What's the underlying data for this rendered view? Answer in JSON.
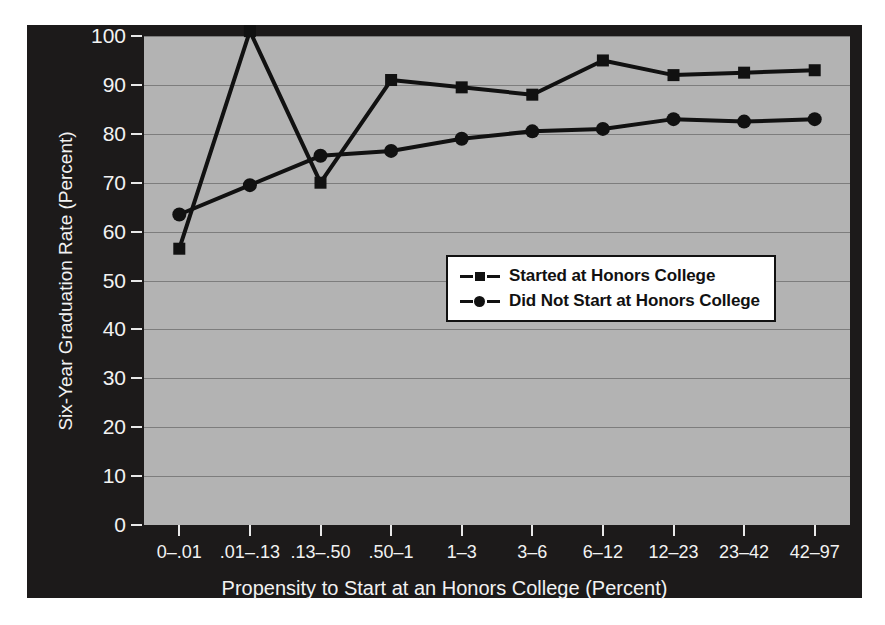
{
  "chart_data": {
    "type": "line",
    "title": "",
    "xlabel": "Propensity to Start at an Honors College (Percent)",
    "ylabel": "Six-Year Graduation Rate (Percent)",
    "categories": [
      "0–.01",
      ".01–.13",
      ".13–.50",
      ".50–1",
      "1–3",
      "3–6",
      "6–12",
      "12–23",
      "23–42",
      "42–97"
    ],
    "ylim": [
      0,
      100
    ],
    "yticks": [
      0,
      10,
      20,
      30,
      40,
      50,
      60,
      70,
      80,
      90,
      100
    ],
    "ytick_labels": [
      "0",
      "10",
      "20",
      "30",
      "40",
      "50",
      "60",
      "70",
      "80",
      "90",
      "100"
    ],
    "grid": true,
    "legend_position": "center-right",
    "series": [
      {
        "name": "Started at Honors College",
        "marker": "square",
        "values": [
          56.5,
          101.0,
          70.0,
          91.0,
          89.5,
          88.0,
          95.0,
          92.0,
          92.5,
          93.0
        ]
      },
      {
        "name": "Did Not Start at Honors College",
        "marker": "circle",
        "values": [
          63.5,
          69.5,
          75.5,
          76.5,
          79.0,
          80.5,
          81.0,
          83.0,
          82.5,
          83.0
        ]
      }
    ]
  },
  "legend": {
    "items": [
      {
        "label": "Started at Honors College",
        "marker": "square"
      },
      {
        "label": "Did Not Start at Honors College",
        "marker": "circle"
      }
    ]
  },
  "colors": {
    "panel_background": "#1c1a1a",
    "plot_background": "#b3b3b3",
    "line": "#111111",
    "gridline": "#7d7d7d",
    "axis_text": "#f2f2f2",
    "legend_background": "#ffffff",
    "legend_border": "#111111"
  }
}
